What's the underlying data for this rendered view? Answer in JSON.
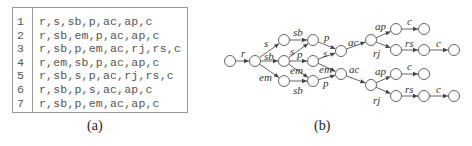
{
  "table": {
    "rows": [
      {
        "num": "1",
        "seq": "r,s,sb,p,ac,ap,c"
      },
      {
        "num": "2",
        "seq": "r,sb,em,p,ac,ap,c"
      },
      {
        "num": "3",
        "seq": "r,sb,p,em,ac,rj,rs,c"
      },
      {
        "num": "4",
        "seq": "r,em,sb,p,ac,ap,c"
      },
      {
        "num": "5",
        "seq": "r,sb,s,p,ac,rj,rs,c"
      },
      {
        "num": "6",
        "seq": "r,sb,p,s,ac,ap,c"
      },
      {
        "num": "7",
        "seq": "r,sb,p,em,ac,ap,c"
      }
    ]
  },
  "captions": {
    "a": "(a)",
    "b": "(b)"
  },
  "graph": {
    "nodes": [
      {
        "id": "n0",
        "x": 230,
        "y": 61
      },
      {
        "id": "n1",
        "x": 255,
        "y": 61
      },
      {
        "id": "n2a",
        "x": 284,
        "y": 40
      },
      {
        "id": "n2b",
        "x": 284,
        "y": 61
      },
      {
        "id": "n2c",
        "x": 284,
        "y": 81
      },
      {
        "id": "n3a",
        "x": 313,
        "y": 40
      },
      {
        "id": "n3b",
        "x": 313,
        "y": 61
      },
      {
        "id": "n3c",
        "x": 313,
        "y": 81
      },
      {
        "id": "n4a",
        "x": 341,
        "y": 51
      },
      {
        "id": "n4b",
        "x": 341,
        "y": 74
      },
      {
        "id": "n5a",
        "x": 371,
        "y": 40
      },
      {
        "id": "n5b",
        "x": 371,
        "y": 85
      },
      {
        "id": "n6a",
        "x": 396,
        "y": 29
      },
      {
        "id": "n6b",
        "x": 396,
        "y": 50
      },
      {
        "id": "n6c",
        "x": 396,
        "y": 74
      },
      {
        "id": "n6d",
        "x": 396,
        "y": 96
      },
      {
        "id": "n7a",
        "x": 424,
        "y": 29
      },
      {
        "id": "n7b",
        "x": 424,
        "y": 50
      },
      {
        "id": "n7c",
        "x": 424,
        "y": 74
      },
      {
        "id": "n7d",
        "x": 424,
        "y": 96
      },
      {
        "id": "n8b",
        "x": 454,
        "y": 50
      },
      {
        "id": "n8d",
        "x": 454,
        "y": 96
      }
    ],
    "edges": [
      {
        "from": "n0",
        "to": "n1",
        "label": "r",
        "lx": 241,
        "ly": 57
      },
      {
        "from": "n1",
        "to": "n2a",
        "label": "s",
        "lx": 264,
        "ly": 47
      },
      {
        "from": "n1",
        "to": "n2b",
        "label": "sb",
        "lx": 264,
        "ly": 60
      },
      {
        "from": "n1",
        "to": "n2c",
        "label": "em",
        "lx": 259,
        "ly": 81
      },
      {
        "from": "n2a",
        "to": "n3a",
        "label": "sb",
        "lx": 293,
        "ly": 36
      },
      {
        "from": "n2b",
        "to": "n3a",
        "label": "s",
        "lx": 290,
        "ly": 55
      },
      {
        "from": "n2b",
        "to": "n3b",
        "label": "p",
        "lx": 297,
        "ly": 58
      },
      {
        "from": "n2b",
        "to": "n3c",
        "label": "em",
        "lx": 290,
        "ly": 74
      },
      {
        "from": "n2c",
        "to": "n3c",
        "label": "sb",
        "lx": 293,
        "ly": 94
      },
      {
        "from": "n3a",
        "to": "n4a",
        "label": "p",
        "lx": 324,
        "ly": 41
      },
      {
        "from": "n3b",
        "to": "n4a",
        "label": "s",
        "lx": 323,
        "ly": 57
      },
      {
        "from": "n3b",
        "to": "n4b",
        "label": "em",
        "lx": 319,
        "ly": 73
      },
      {
        "from": "n3c",
        "to": "n4b",
        "label": "p",
        "lx": 323,
        "ly": 87
      },
      {
        "from": "n4a",
        "to": "n5a",
        "label": "ac",
        "lx": 348,
        "ly": 46
      },
      {
        "from": "n4b",
        "to": "n5b",
        "label": "ac",
        "lx": 349,
        "ly": 73
      },
      {
        "from": "n5a",
        "to": "n6a",
        "label": "ap",
        "lx": 375,
        "ly": 30
      },
      {
        "from": "n5a",
        "to": "n6b",
        "label": "rj",
        "lx": 373,
        "ly": 57
      },
      {
        "from": "n5b",
        "to": "n6c",
        "label": "ap",
        "lx": 375,
        "ly": 75
      },
      {
        "from": "n5b",
        "to": "n6d",
        "label": "rj",
        "lx": 373,
        "ly": 104
      },
      {
        "from": "n6a",
        "to": "n7a",
        "label": "c",
        "lx": 407,
        "ly": 25
      },
      {
        "from": "n6b",
        "to": "n7b",
        "label": "rs",
        "lx": 405,
        "ly": 47
      },
      {
        "from": "n6c",
        "to": "n7c",
        "label": "c",
        "lx": 407,
        "ly": 70
      },
      {
        "from": "n6d",
        "to": "n7d",
        "label": "rs",
        "lx": 405,
        "ly": 93
      },
      {
        "from": "n7b",
        "to": "n8b",
        "label": "c",
        "lx": 436,
        "ly": 47
      },
      {
        "from": "n7d",
        "to": "n8d",
        "label": "c",
        "lx": 436,
        "ly": 93
      }
    ]
  }
}
